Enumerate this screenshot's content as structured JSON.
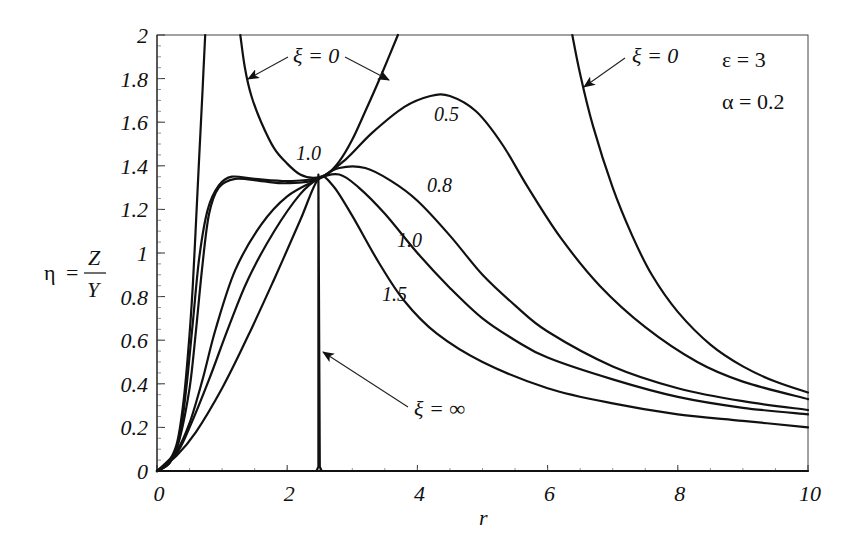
{
  "chart_data": {
    "type": "line",
    "title": "",
    "xlabel": "r",
    "ylabel": "η = Z / Y",
    "ylabel_parts": {
      "lhs": "η",
      "eq": "=",
      "num": "Z",
      "den": "Y"
    },
    "xlim": [
      0,
      10
    ],
    "ylim": [
      0,
      2
    ],
    "grid": false,
    "x_ticks": [
      {
        "value": 0,
        "label": "0"
      },
      {
        "value": 2,
        "label": "2"
      },
      {
        "value": 4,
        "label": "4"
      },
      {
        "value": 6,
        "label": "6"
      },
      {
        "value": 8,
        "label": "8"
      },
      {
        "value": 10,
        "label": "10"
      }
    ],
    "y_ticks": [
      {
        "value": 0,
        "label": "0"
      },
      {
        "value": 0.2,
        "label": "0.2"
      },
      {
        "value": 0.4,
        "label": "0.4"
      },
      {
        "value": 0.6,
        "label": "0.6"
      },
      {
        "value": 0.8,
        "label": "0.8"
      },
      {
        "value": 1.0,
        "label": "1"
      },
      {
        "value": 1.2,
        "label": "1.2"
      },
      {
        "value": 1.4,
        "label": "1.4"
      },
      {
        "value": 1.6,
        "label": "1.6"
      },
      {
        "value": 1.8,
        "label": "1.8"
      },
      {
        "value": 2.0,
        "label": "2"
      }
    ],
    "parameters": [
      {
        "label": "ε = 3"
      },
      {
        "label": "α = 0.2"
      }
    ],
    "series": [
      {
        "name": "ξ = 0 (left branch)",
        "points": [
          [
            0,
            0
          ],
          [
            0.15,
            0.03
          ],
          [
            0.3,
            0.12
          ],
          [
            0.4,
            0.3
          ],
          [
            0.48,
            0.55
          ],
          [
            0.55,
            0.85
          ],
          [
            0.6,
            1.15
          ],
          [
            0.65,
            1.45
          ],
          [
            0.7,
            1.75
          ],
          [
            0.74,
            2.0
          ]
        ]
      },
      {
        "name": "ξ = 0 (middle branch)",
        "points": [
          [
            1.28,
            2.0
          ],
          [
            1.35,
            1.85
          ],
          [
            1.45,
            1.72
          ],
          [
            1.6,
            1.6
          ],
          [
            1.8,
            1.48
          ],
          [
            2.0,
            1.41
          ],
          [
            2.2,
            1.36
          ],
          [
            2.4,
            1.345
          ],
          [
            2.6,
            1.36
          ],
          [
            2.8,
            1.42
          ],
          [
            3.0,
            1.52
          ],
          [
            3.2,
            1.65
          ],
          [
            3.45,
            1.82
          ],
          [
            3.7,
            2.0
          ]
        ]
      },
      {
        "name": "ξ = 0 (right branch)",
        "points": [
          [
            6.38,
            2.0
          ],
          [
            6.5,
            1.82
          ],
          [
            6.7,
            1.58
          ],
          [
            7.0,
            1.3
          ],
          [
            7.3,
            1.08
          ],
          [
            7.6,
            0.9
          ],
          [
            8.0,
            0.73
          ],
          [
            8.5,
            0.58
          ],
          [
            9.0,
            0.48
          ],
          [
            9.5,
            0.41
          ],
          [
            10.0,
            0.36
          ]
        ]
      },
      {
        "name": "ξ = 0.5",
        "label": "0.5",
        "points": [
          [
            0,
            0
          ],
          [
            0.2,
            0.04
          ],
          [
            0.35,
            0.15
          ],
          [
            0.5,
            0.38
          ],
          [
            0.6,
            0.65
          ],
          [
            0.7,
            0.95
          ],
          [
            0.8,
            1.18
          ],
          [
            0.95,
            1.3
          ],
          [
            1.2,
            1.34
          ],
          [
            1.6,
            1.33
          ],
          [
            2.0,
            1.32
          ],
          [
            2.48,
            1.34
          ],
          [
            2.9,
            1.43
          ],
          [
            3.3,
            1.55
          ],
          [
            3.8,
            1.67
          ],
          [
            4.2,
            1.72
          ],
          [
            4.5,
            1.72
          ],
          [
            4.9,
            1.65
          ],
          [
            5.3,
            1.5
          ],
          [
            5.7,
            1.3
          ],
          [
            6.2,
            1.07
          ],
          [
            6.8,
            0.85
          ],
          [
            7.5,
            0.66
          ],
          [
            8.3,
            0.5
          ],
          [
            9.0,
            0.41
          ],
          [
            10.0,
            0.33
          ]
        ]
      },
      {
        "name": "ξ = 0.8",
        "label": "0.8",
        "points": [
          [
            0,
            0
          ],
          [
            0.3,
            0.09
          ],
          [
            0.5,
            0.22
          ],
          [
            0.7,
            0.42
          ],
          [
            0.9,
            0.65
          ],
          [
            1.2,
            0.92
          ],
          [
            1.6,
            1.13
          ],
          [
            2.0,
            1.26
          ],
          [
            2.48,
            1.34
          ],
          [
            2.8,
            1.39
          ],
          [
            3.2,
            1.39
          ],
          [
            3.6,
            1.33
          ],
          [
            4.0,
            1.24
          ],
          [
            4.5,
            1.08
          ],
          [
            5.0,
            0.9
          ],
          [
            5.5,
            0.76
          ],
          [
            6.0,
            0.64
          ],
          [
            7.0,
            0.48
          ],
          [
            8.0,
            0.38
          ],
          [
            9.0,
            0.32
          ],
          [
            10.0,
            0.28
          ]
        ]
      },
      {
        "name": "ξ = 1.0",
        "label": "1.0",
        "points": [
          [
            0,
            0
          ],
          [
            0.3,
            0.08
          ],
          [
            0.5,
            0.2
          ],
          [
            0.8,
            0.42
          ],
          [
            1.1,
            0.66
          ],
          [
            1.4,
            0.88
          ],
          [
            1.8,
            1.1
          ],
          [
            2.2,
            1.27
          ],
          [
            2.48,
            1.34
          ],
          [
            2.8,
            1.36
          ],
          [
            3.1,
            1.3
          ],
          [
            3.5,
            1.18
          ],
          [
            4.0,
            1.0
          ],
          [
            4.5,
            0.84
          ],
          [
            5.0,
            0.7
          ],
          [
            5.5,
            0.6
          ],
          [
            6.0,
            0.52
          ],
          [
            7.0,
            0.42
          ],
          [
            8.0,
            0.34
          ],
          [
            9.0,
            0.29
          ],
          [
            10.0,
            0.26
          ]
        ]
      },
      {
        "name": "ξ = 1.5",
        "label": "1.5",
        "points": [
          [
            0,
            0
          ],
          [
            0.3,
            0.07
          ],
          [
            0.6,
            0.18
          ],
          [
            1.0,
            0.38
          ],
          [
            1.4,
            0.62
          ],
          [
            1.8,
            0.88
          ],
          [
            2.2,
            1.15
          ],
          [
            2.48,
            1.34
          ],
          [
            2.7,
            1.31
          ],
          [
            3.0,
            1.17
          ],
          [
            3.4,
            0.96
          ],
          [
            3.8,
            0.78
          ],
          [
            4.3,
            0.63
          ],
          [
            5.0,
            0.5
          ],
          [
            6.0,
            0.38
          ],
          [
            7.0,
            0.31
          ],
          [
            8.0,
            0.26
          ],
          [
            9.0,
            0.23
          ],
          [
            10.0,
            0.2
          ]
        ]
      },
      {
        "name": "ξ = 1.0 (plateau)",
        "label": "1.0",
        "points": [
          [
            0,
            0
          ],
          [
            0.2,
            0.04
          ],
          [
            0.35,
            0.16
          ],
          [
            0.45,
            0.38
          ],
          [
            0.55,
            0.68
          ],
          [
            0.65,
            0.98
          ],
          [
            0.78,
            1.2
          ],
          [
            0.95,
            1.31
          ],
          [
            1.15,
            1.35
          ],
          [
            1.5,
            1.34
          ],
          [
            2.0,
            1.33
          ],
          [
            2.48,
            1.34
          ]
        ]
      },
      {
        "name": "ξ = ∞",
        "label": "ξ = ∞",
        "points": [
          [
            0,
            0
          ],
          [
            2.45,
            0
          ],
          [
            2.48,
            0.02
          ],
          [
            2.48,
            1.36
          ],
          [
            2.5,
            0.02
          ],
          [
            2.53,
            0
          ],
          [
            10,
            0
          ]
        ]
      }
    ],
    "annotations": [
      {
        "text": "ξ = 0",
        "at": [
          2.1,
          1.89
        ],
        "arrows_to": [
          [
            1.37,
            1.8
          ],
          [
            3.5,
            1.8
          ]
        ]
      },
      {
        "text": "ξ = 0",
        "at": [
          7.3,
          1.93
        ],
        "arrows_to": [
          [
            6.47,
            1.84
          ]
        ]
      },
      {
        "text": "ξ = ∞",
        "at": [
          3.8,
          0.29
        ],
        "arrows_to": [
          [
            2.51,
            0.55
          ]
        ]
      },
      {
        "text": "0.5",
        "at": [
          4.28,
          1.6
        ]
      },
      {
        "text": "0.8",
        "at": [
          4.4,
          1.25
        ]
      },
      {
        "text": "1.0",
        "at": [
          4.25,
          0.98
        ]
      },
      {
        "text": "1.5",
        "at": [
          3.22,
          0.78
        ]
      },
      {
        "text": "1.0",
        "at": [
          2.05,
          1.42
        ]
      }
    ]
  },
  "labels": {
    "x_axis": "r",
    "eps": "ε = 3",
    "alpha": "α = 0.2",
    "xi0_a": "ξ = 0",
    "xi0_b": "ξ = 0",
    "xi_inf": "ξ = ∞",
    "c05": "0.5",
    "c08": "0.8",
    "c10": "1.0",
    "c15": "1.5",
    "c10_top": "1.0",
    "eta": "η",
    "eq": "=",
    "Z": "Z",
    "Y": "Y"
  }
}
